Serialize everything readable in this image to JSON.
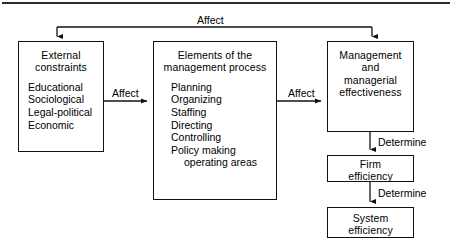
{
  "diagram": {
    "title": "Affect",
    "nodes": {
      "external": {
        "heading_line1": "External",
        "heading_line2": "constraints",
        "items": [
          "Educational",
          "Sociological",
          "Legal-political",
          "Economic"
        ]
      },
      "elements": {
        "heading_line1": "Elements of  the",
        "heading_line2": "management  process",
        "items": [
          "Planning",
          "Organizing",
          "Staffing",
          "Directing",
          "Controlling",
          "Policy  making"
        ],
        "item_indented": "operating  areas"
      },
      "management": {
        "line1": "Management",
        "line2": "and",
        "line3": "managerial",
        "line4": "effectiveness"
      },
      "firm": {
        "line1": "Firm",
        "line2": "efficiency"
      },
      "system": {
        "line1": "System",
        "line2": "efficiency"
      }
    },
    "edges": {
      "affect_top": "Affect",
      "affect_left": "Affect",
      "affect_right": "Affect",
      "determine_1": "Determine",
      "determine_2": "Determine"
    }
  }
}
